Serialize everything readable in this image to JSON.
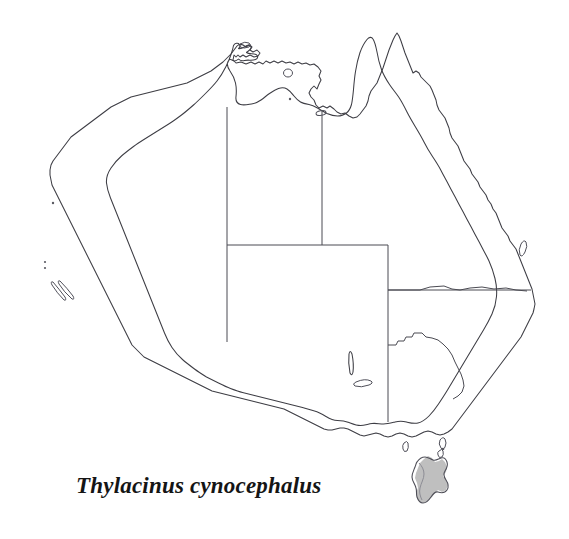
{
  "figure": {
    "kind": "distribution-map",
    "caption": "Thylacinus cynocephalus",
    "background_color": "#ffffff",
    "outline_color": "#3d3d44",
    "border_color": "#4a4a52",
    "range_fill_color": "#bfbfbf",
    "width": 569,
    "height": 539
  },
  "map": {
    "region_name": "Australia",
    "landmasses": [
      {
        "name": "mainland-australia",
        "shaded": false
      },
      {
        "name": "tasmania",
        "shaded": true
      },
      {
        "name": "king-island",
        "shaded": false
      },
      {
        "name": "flinders-island",
        "shaded": false
      },
      {
        "name": "kangaroo-island",
        "shaded": false
      },
      {
        "name": "groote-eylandt",
        "shaded": false
      },
      {
        "name": "melville-island",
        "shaded": false
      },
      {
        "name": "fraser-island",
        "shaded": false
      },
      {
        "name": "dirk-hartog-island",
        "shaded": false
      }
    ],
    "internal_borders": [
      "wa-nt-sa-vertical-west",
      "nt-qld-vertical-east",
      "nt-sa-horizontal",
      "sa-nsw-horizontal",
      "sa-vic-nsw-vertical",
      "qld-nsw-horizontal",
      "nsw-vic-murray"
    ],
    "shaded_regions": [
      {
        "name": "tasmania",
        "label": "historic distribution",
        "fill": "#bfbfbf"
      }
    ]
  }
}
